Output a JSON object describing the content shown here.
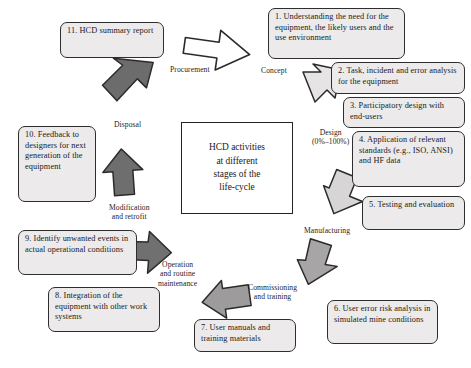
{
  "diagram": {
    "title": "HCD activities at different stages of the life-cycle",
    "center": {
      "line1": "HCD activities",
      "line2": "at different",
      "line3": "stages of the",
      "line4": "life-cycle"
    },
    "colors": {
      "node_fill": "#eceaea",
      "node_border": "#2e2e2e",
      "arrow_dark": "#6d6d6d",
      "arrow_mid": "#9a9a9a",
      "arrow_light": "#d5d3d3",
      "arrow_white": "#ffffff",
      "arrow_outline": "#2b2b2b",
      "text": "#1a1a1a",
      "background": "#ffffff"
    },
    "nodes": [
      {
        "id": "node-1",
        "text": "1. Understanding the need for the equipment, the likely users and the use environment"
      },
      {
        "id": "node-2",
        "text": "2. Task, incident and error analysis for the equipment"
      },
      {
        "id": "node-3",
        "text": "3. Participatory design with end-users"
      },
      {
        "id": "node-4",
        "text": "4. Application of relevant standards (e.g., ISO, ANSI) and HF data"
      },
      {
        "id": "node-5",
        "text": "5. Testing and evaluation"
      },
      {
        "id": "node-6",
        "text": "6. User error risk analysis in simulated mine conditions"
      },
      {
        "id": "node-7",
        "text": "7. User manuals and training materials"
      },
      {
        "id": "node-8",
        "text": "8. Integration of the equipment with other work systems"
      },
      {
        "id": "node-9",
        "text": "9. Identify unwanted events in actual operational conditions"
      },
      {
        "id": "node-10",
        "text": "10. Feedback to designers for next generation of the equipment"
      },
      {
        "id": "node-11",
        "text": "11. HCD summary report"
      }
    ],
    "stage_labels": [
      {
        "id": "label-procurement",
        "text": "Procurement"
      },
      {
        "id": "label-concept",
        "text": "Concept"
      },
      {
        "id": "label-design",
        "text": "Design\n(0%–100%)"
      },
      {
        "id": "label-manufacturing",
        "text": "Manufacturing"
      },
      {
        "id": "label-commissioning",
        "text": "Commissioning\nand training"
      },
      {
        "id": "label-operation",
        "text": "Operation\nand routine\nmaintenance"
      },
      {
        "id": "label-modification",
        "text": "Modification\nand retrofit"
      },
      {
        "id": "label-disposal",
        "text": "Disposal"
      }
    ],
    "arrows": [
      {
        "id": "arrow-procurement-to-concept",
        "style": "outline"
      },
      {
        "id": "arrow-concept-to-design",
        "style": "light"
      },
      {
        "id": "arrow-design-to-manufacturing",
        "style": "light"
      },
      {
        "id": "arrow-manufacturing-to-commissioning",
        "style": "mid"
      },
      {
        "id": "arrow-commissioning-to-operation",
        "style": "mid"
      },
      {
        "id": "arrow-operation-to-modification",
        "style": "dark"
      },
      {
        "id": "arrow-modification-to-disposal",
        "style": "dark"
      },
      {
        "id": "arrow-disposal-to-procurement",
        "style": "dark"
      }
    ]
  }
}
